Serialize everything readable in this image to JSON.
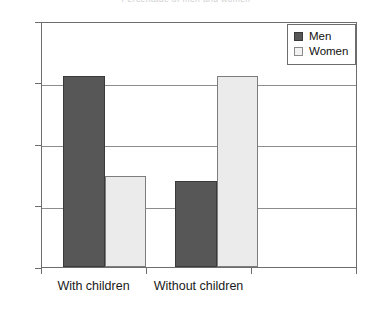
{
  "chart_data": {
    "type": "bar",
    "title": "Percentage of men and women",
    "categories": [
      "With children",
      "Without children"
    ],
    "series": [
      {
        "name": "Men",
        "color": "#575757",
        "values": [
          62,
          28
        ]
      },
      {
        "name": "Women",
        "color": "#ebebeb",
        "values": [
          29.5,
          62
        ]
      }
    ],
    "xlabel": "",
    "ylabel": "",
    "ylim": [
      0,
      80
    ],
    "yticks": [
      0,
      20,
      40,
      60,
      80
    ],
    "ytick_labels": [
      "0",
      "20",
      "40",
      "60",
      "80"
    ],
    "grid": true,
    "legend_position": "top-right"
  },
  "legend": {
    "entries": [
      {
        "label": "Men"
      },
      {
        "label": "Women"
      }
    ]
  }
}
